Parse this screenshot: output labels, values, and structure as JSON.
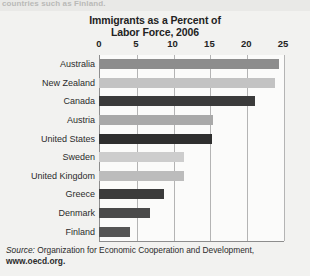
{
  "clipped_top_line": "countries such as Finland.",
  "chart_data": {
    "type": "bar",
    "orientation": "horizontal",
    "title": "Immigrants as a Percent of\nLabor Force, 2006",
    "title_line1": "Immigrants as a Percent of",
    "title_line2": "Labor Force, 2006",
    "xlabel": "",
    "ylabel": "",
    "xlim": [
      0,
      25
    ],
    "xticks": [
      0,
      5,
      10,
      15,
      20,
      25
    ],
    "xtick_labels": [
      "0",
      "5",
      "10",
      "15",
      "20",
      "25"
    ],
    "grid": "vertical",
    "legend": "none",
    "categories": [
      "Australia",
      "New Zealand",
      "Canada",
      "Austria",
      "United States",
      "Sweden",
      "United Kingdom",
      "Greece",
      "Denmark",
      "Finland"
    ],
    "values": [
      24.4,
      23.9,
      21.2,
      15.5,
      15.3,
      11.6,
      11.5,
      8.8,
      6.9,
      4.2
    ],
    "bar_colors": [
      "#8d8d8d",
      "#c3c3c3",
      "#3b3b3b",
      "#a9a9a9",
      "#2f2f2f",
      "#cdcdcd",
      "#bcbcbc",
      "#3b3b3b",
      "#4a4a4a",
      "#555555"
    ]
  },
  "source": {
    "lead": "Source:",
    "text": " Organization for Economic Cooperation and Development,",
    "url": "www.oecd.org."
  },
  "colors": {
    "page_background": "#e9e9e7",
    "figure_background": "#f2f2f0",
    "plot_background": "#fbfbfa",
    "axis": "#8d8d8d",
    "gridline": "#b4b4b4",
    "text": "#232323"
  }
}
